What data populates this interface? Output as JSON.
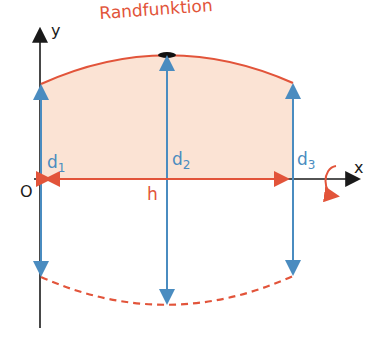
{
  "diagram": {
    "title": "Randfunktion",
    "axes": {
      "x_label": "x",
      "y_label": "y",
      "origin_label": "O"
    },
    "distances": [
      {
        "name": "d",
        "sub": "1"
      },
      {
        "name": "d",
        "sub": "2"
      },
      {
        "name": "d",
        "sub": "3"
      }
    ],
    "width_label": "h",
    "colors": {
      "curve": "#e2543a",
      "fill": "#fbe3d4",
      "arrows": "#4a8cc0",
      "axis": "#1a1a1a"
    }
  }
}
